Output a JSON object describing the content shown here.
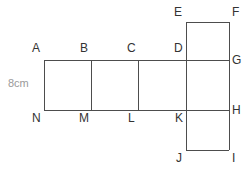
{
  "figure": {
    "stroke_color": "#4d4d4d",
    "label_color": "#333333",
    "dimension_color": "#9a9a9a",
    "background_color": "#ffffff",
    "dimension": {
      "text": "8cm",
      "value": 8,
      "unit": "cm",
      "edge": "A-N",
      "x": 8,
      "y": 78
    },
    "vertices": [
      {
        "id": "A",
        "label": "A",
        "x": 44,
        "y": 60,
        "lx": 32,
        "ly": 42
      },
      {
        "id": "B",
        "label": "B",
        "x": 91,
        "y": 60,
        "lx": 80,
        "ly": 42
      },
      {
        "id": "C",
        "label": "C",
        "x": 138,
        "y": 60,
        "lx": 127,
        "ly": 42
      },
      {
        "id": "D",
        "label": "D",
        "x": 186,
        "y": 60,
        "lx": 174,
        "ly": 42
      },
      {
        "id": "E",
        "label": "E",
        "x": 186,
        "y": 22,
        "lx": 174,
        "ly": 6
      },
      {
        "id": "F",
        "label": "F",
        "x": 229,
        "y": 22,
        "lx": 232,
        "ly": 6
      },
      {
        "id": "G",
        "label": "G",
        "x": 229,
        "y": 60,
        "lx": 232,
        "ly": 54
      },
      {
        "id": "H",
        "label": "H",
        "x": 229,
        "y": 110,
        "lx": 232,
        "ly": 104
      },
      {
        "id": "I",
        "label": "I",
        "x": 229,
        "y": 150,
        "lx": 232,
        "ly": 152
      },
      {
        "id": "J",
        "label": "J",
        "x": 186,
        "y": 150,
        "lx": 176,
        "ly": 152
      },
      {
        "id": "K",
        "label": "K",
        "x": 186,
        "y": 110,
        "lx": 175,
        "ly": 112
      },
      {
        "id": "L",
        "label": "L",
        "x": 138,
        "y": 110,
        "lx": 128,
        "ly": 112
      },
      {
        "id": "M",
        "label": "M",
        "x": 91,
        "y": 110,
        "lx": 79,
        "ly": 112
      },
      {
        "id": "N",
        "label": "N",
        "x": 44,
        "y": 110,
        "lx": 32,
        "ly": 112
      }
    ],
    "edges": [
      {
        "name": "edge-A-G-top",
        "x1": 44,
        "y1": 60,
        "x2": 229,
        "y2": 60
      },
      {
        "name": "edge-N-H-bottom",
        "x1": 44,
        "y1": 110,
        "x2": 229,
        "y2": 110
      },
      {
        "name": "edge-A-N",
        "x1": 44,
        "y1": 60,
        "x2": 44,
        "y2": 110
      },
      {
        "name": "edge-B-M",
        "x1": 91,
        "y1": 60,
        "x2": 91,
        "y2": 110
      },
      {
        "name": "edge-C-L",
        "x1": 138,
        "y1": 60,
        "x2": 138,
        "y2": 110
      },
      {
        "name": "edge-D-K",
        "x1": 186,
        "y1": 60,
        "x2": 186,
        "y2": 110
      },
      {
        "name": "edge-G-H",
        "x1": 229,
        "y1": 60,
        "x2": 229,
        "y2": 110
      },
      {
        "name": "edge-E-F",
        "x1": 186,
        "y1": 22,
        "x2": 229,
        "y2": 22
      },
      {
        "name": "edge-E-D",
        "x1": 186,
        "y1": 22,
        "x2": 186,
        "y2": 60
      },
      {
        "name": "edge-F-G",
        "x1": 229,
        "y1": 22,
        "x2": 229,
        "y2": 60
      },
      {
        "name": "edge-K-J",
        "x1": 186,
        "y1": 110,
        "x2": 186,
        "y2": 150
      },
      {
        "name": "edge-H-I",
        "x1": 229,
        "y1": 110,
        "x2": 229,
        "y2": 150
      },
      {
        "name": "edge-J-I",
        "x1": 186,
        "y1": 150,
        "x2": 229,
        "y2": 150
      }
    ]
  }
}
